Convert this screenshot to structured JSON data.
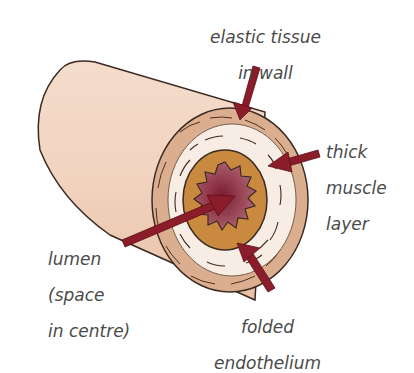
{
  "colors": {
    "outer_wall": "#f2d6c3",
    "outer_wall_shadow": "#e3b9a0",
    "elastic_layer": "#d9ab8d",
    "muscle_layer": "#f7ede4",
    "endothelium": "#c98a3f",
    "lumen": "#8e2a3e",
    "arrow": "#8b1c2a",
    "outline": "#3b2a22",
    "label_text": "#4a4a4a"
  },
  "labels": {
    "elastic": {
      "line1": "elastic tissue",
      "line2": "in wall"
    },
    "muscle": {
      "line1": "thick",
      "line2": "muscle",
      "line3": "layer"
    },
    "lumen": {
      "line1": "lumen",
      "line2": "(space",
      "line3": "in centre)"
    },
    "endothelium": {
      "line1": "folded",
      "line2": "endothelium"
    }
  }
}
